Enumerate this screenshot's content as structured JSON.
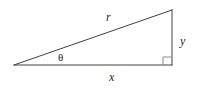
{
  "figure": {
    "kind": "right-triangle-geometry-diagram",
    "background_color": "#ffffff",
    "stroke_color": "#404042",
    "text_color": "#231f20",
    "labels": {
      "hypotenuse": "r",
      "opposite_leg": "y",
      "adjacent_leg": "x",
      "angle": "θ"
    },
    "geometry": {
      "left_vertex": "14,65",
      "right_angle_vertex": "172,65",
      "apex_vertex": "172,10",
      "right_angle_marker_size": 8
    }
  }
}
